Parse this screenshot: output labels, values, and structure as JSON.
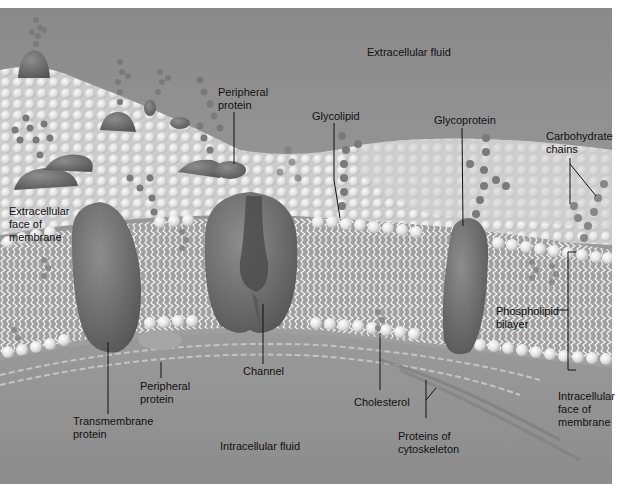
{
  "diagram": {
    "regions": {
      "extracellular_fluid": "Extracellular fluid",
      "intracellular_fluid": "Intracellular fluid"
    },
    "labels": {
      "peripheral_protein_top": "Peripheral\nprotein",
      "glycolipid": "Glycolipid",
      "glycoprotein": "Glycoprotein",
      "carbohydrate_chains": "Carbohydrate\nchains",
      "extracellular_face": "Extracellular\nface of\nmembrane",
      "phospholipid_bilayer": "Phospholipid\nbilayer",
      "channel": "Channel",
      "peripheral_protein_bottom": "Peripheral\nprotein",
      "transmembrane_protein": "Transmembrane\nprotein",
      "cholesterol": "Cholesterol",
      "proteins_of_cytoskeleton": "Proteins of\ncytoskeleton",
      "intracellular_face": "Intracellular\nface of\nmembrane"
    },
    "colors": {
      "background_gray": "#8e8e8e",
      "bilayer_gray": "#9a9a9a",
      "head_white": "#eeeeee",
      "protein_gray": "#6e6e6e",
      "sugar_gray": "#7d7d7d",
      "leader_line": "#111111"
    }
  }
}
